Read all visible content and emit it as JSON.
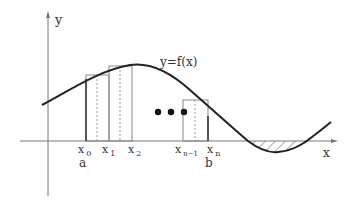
{
  "diagram": {
    "y_axis_label": "y",
    "x_axis_label": "x",
    "curve_label": "y=f(x)",
    "ellipsis": "•••",
    "partition": [
      {
        "base": "x",
        "sub": "0",
        "below": "a"
      },
      {
        "base": "x",
        "sub": "1",
        "below": ""
      },
      {
        "base": "x",
        "sub": "2",
        "below": ""
      },
      {
        "base": "x",
        "sub": "n−1",
        "below": ""
      },
      {
        "base": "x",
        "sub": "n",
        "below": "b"
      }
    ]
  }
}
